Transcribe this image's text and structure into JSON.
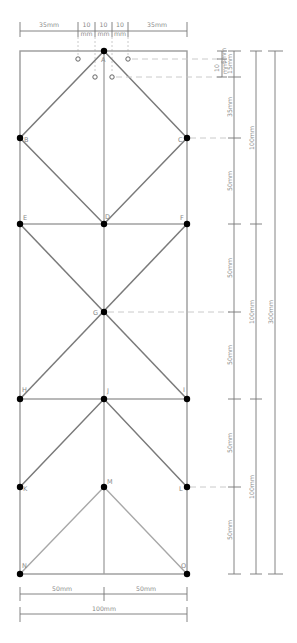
{
  "diagram": {
    "points": {
      "A": "A",
      "B": "B",
      "C": "C",
      "D": "D",
      "E": "E",
      "F": "F",
      "G": "G",
      "H": "H",
      "I": "I",
      "J": "J",
      "K": "K",
      "L": "L",
      "M": "M",
      "N": "N",
      "O": "O"
    },
    "top_dims": {
      "left": "35mm",
      "seg1_top": "10",
      "seg1_bot": "mm",
      "seg2_top": "10",
      "seg2_bot": "mm",
      "seg3_top": "10",
      "seg3_bot": "mm",
      "right": "35mm"
    },
    "right_dims": {
      "small_5": "5mm",
      "small_10_top": "10",
      "small_10_bot": "mm",
      "d15": "15mm",
      "d35": "35mm",
      "d50_a": "50mm",
      "d50_b": "50mm",
      "d50_c": "50mm",
      "d50_d": "50mm",
      "d50_e": "50mm",
      "h100_a": "100mm",
      "h100_b": "100mm",
      "h100_c": "100mm",
      "h300": "300mm"
    },
    "bottom_dims": {
      "left": "50mm",
      "right": "50mm",
      "total": "100mm"
    }
  }
}
